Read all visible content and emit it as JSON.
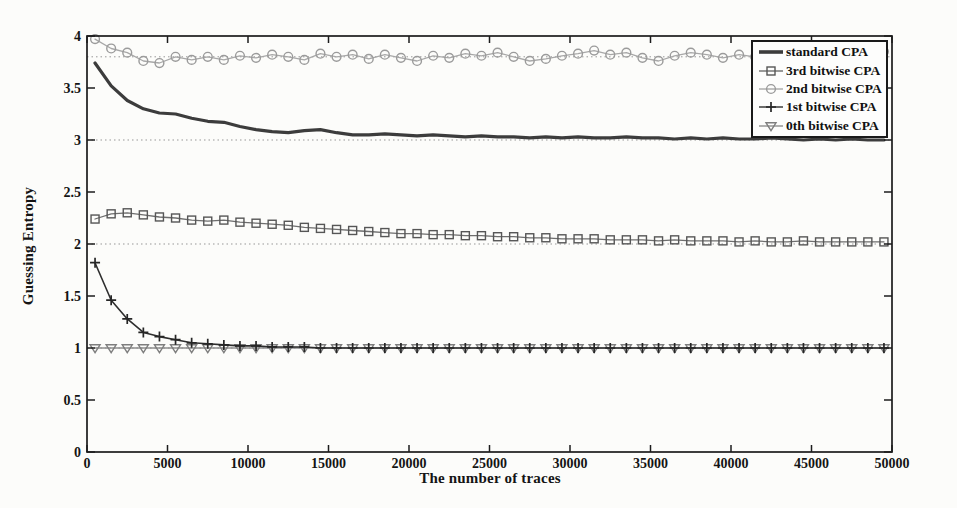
{
  "figure": {
    "background": "#fcfcfa",
    "axis_color": "#1c1c1c",
    "text_color": "#141414",
    "reference_line_color": "#979797"
  },
  "chart_data": {
    "type": "line",
    "title": "",
    "xlabel": "The number of traces",
    "ylabel": "Guessing Entropy",
    "xlim": [
      0,
      50000
    ],
    "ylim": [
      0,
      4
    ],
    "x_ticks": [
      0,
      5000,
      10000,
      15000,
      20000,
      25000,
      30000,
      35000,
      40000,
      45000,
      50000
    ],
    "y_ticks": [
      0,
      0.5,
      1,
      1.5,
      2,
      2.5,
      3,
      3.5,
      4
    ],
    "grid": "off",
    "reference_lines_y": [
      1.0,
      2.0,
      3.0,
      3.8
    ],
    "legend_position": "top-right",
    "x": [
      500,
      1500,
      2500,
      3500,
      4500,
      5500,
      6500,
      7500,
      8500,
      9500,
      10500,
      11500,
      12500,
      13500,
      14500,
      15500,
      16500,
      17500,
      18500,
      19500,
      20500,
      21500,
      22500,
      23500,
      24500,
      25500,
      26500,
      27500,
      28500,
      29500,
      30500,
      31500,
      32500,
      33500,
      34500,
      35500,
      36500,
      37500,
      38500,
      39500,
      40500,
      41500,
      42500,
      43500,
      44500,
      45500,
      46500,
      47500,
      48500,
      49500
    ],
    "series": [
      {
        "name": "standard CPA",
        "marker": "none",
        "color": "#3c3c3c",
        "line_width": 3.2,
        "values": [
          3.74,
          3.52,
          3.38,
          3.3,
          3.26,
          3.25,
          3.21,
          3.18,
          3.17,
          3.13,
          3.1,
          3.08,
          3.07,
          3.09,
          3.1,
          3.07,
          3.05,
          3.05,
          3.06,
          3.05,
          3.04,
          3.05,
          3.04,
          3.03,
          3.04,
          3.03,
          3.03,
          3.02,
          3.03,
          3.02,
          3.03,
          3.02,
          3.02,
          3.03,
          3.02,
          3.02,
          3.01,
          3.02,
          3.01,
          3.02,
          3.01,
          3.01,
          3.02,
          3.01,
          3.0,
          3.01,
          3.0,
          3.01,
          3.0,
          3.0
        ]
      },
      {
        "name": "3rd bitwise CPA",
        "marker": "square",
        "color": "#565656",
        "line_color": "#6e6e6e",
        "line_width": 1.3,
        "values": [
          2.24,
          2.29,
          2.3,
          2.28,
          2.26,
          2.25,
          2.23,
          2.22,
          2.23,
          2.21,
          2.2,
          2.19,
          2.18,
          2.16,
          2.15,
          2.14,
          2.13,
          2.12,
          2.11,
          2.1,
          2.1,
          2.09,
          2.09,
          2.08,
          2.08,
          2.07,
          2.07,
          2.06,
          2.06,
          2.05,
          2.05,
          2.05,
          2.04,
          2.04,
          2.04,
          2.03,
          2.04,
          2.03,
          2.03,
          2.03,
          2.02,
          2.03,
          2.02,
          2.02,
          2.03,
          2.02,
          2.02,
          2.02,
          2.02,
          2.02
        ]
      },
      {
        "name": "2nd bitwise CPA",
        "marker": "circle",
        "color": "#9b9b9b",
        "line_color": "#a8a8a8",
        "line_width": 1.3,
        "values": [
          3.97,
          3.88,
          3.84,
          3.76,
          3.74,
          3.8,
          3.77,
          3.8,
          3.77,
          3.81,
          3.79,
          3.82,
          3.8,
          3.77,
          3.83,
          3.8,
          3.82,
          3.78,
          3.82,
          3.79,
          3.76,
          3.81,
          3.79,
          3.83,
          3.81,
          3.84,
          3.8,
          3.76,
          3.78,
          3.81,
          3.83,
          3.86,
          3.82,
          3.84,
          3.79,
          3.76,
          3.81,
          3.84,
          3.82,
          3.79,
          3.82,
          3.8,
          3.83,
          3.85,
          3.82,
          3.79,
          3.82,
          3.8,
          3.81,
          3.85
        ]
      },
      {
        "name": "1st bitwise CPA",
        "marker": "plus",
        "color": "#262626",
        "line_color": "#2e2e2e",
        "line_width": 1.6,
        "values": [
          1.82,
          1.46,
          1.28,
          1.15,
          1.11,
          1.08,
          1.05,
          1.04,
          1.03,
          1.02,
          1.02,
          1.01,
          1.01,
          1.01,
          1.0,
          1.0,
          1.0,
          1.0,
          1.0,
          1.0,
          1.0,
          1.0,
          1.0,
          1.0,
          1.0,
          1.0,
          1.0,
          1.0,
          1.0,
          1.0,
          1.0,
          1.0,
          1.0,
          1.0,
          1.0,
          1.0,
          1.0,
          1.0,
          1.0,
          1.0,
          1.0,
          1.0,
          1.0,
          1.0,
          1.0,
          1.0,
          1.0,
          1.0,
          1.0,
          1.0
        ]
      },
      {
        "name": "0th bitwise CPA",
        "marker": "triangle-down",
        "color": "#7e7e7e",
        "line_color": "#8f8f8f",
        "line_width": 1.3,
        "values": [
          1.0,
          1.0,
          1.0,
          1.0,
          1.0,
          1.0,
          1.0,
          1.0,
          1.0,
          1.0,
          1.0,
          1.0,
          1.0,
          1.0,
          1.0,
          1.0,
          1.0,
          1.0,
          1.0,
          1.0,
          1.0,
          1.0,
          1.0,
          1.0,
          1.0,
          1.0,
          1.0,
          1.0,
          1.0,
          1.0,
          1.0,
          1.0,
          1.0,
          1.0,
          1.0,
          1.0,
          1.0,
          1.0,
          1.0,
          1.0,
          1.0,
          1.0,
          1.0,
          1.0,
          1.0,
          1.0,
          1.0,
          1.0,
          1.0,
          1.0
        ]
      }
    ]
  }
}
